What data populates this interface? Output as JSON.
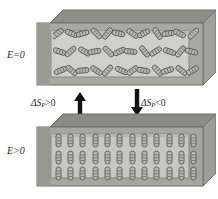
{
  "figure": {
    "background_color": "#ffffff"
  },
  "labels": {
    "field_off": "E=0",
    "field_on": "E>0",
    "entropy_increase": "ΔS",
    "entropy_increase_sub": "P",
    "entropy_increase_op": ">0",
    "entropy_decrease": "ΔS",
    "entropy_decrease_sub": "P",
    "entropy_decrease_op": "<0"
  },
  "arrows": [
    {
      "name": "arrow-up",
      "direction": "up",
      "color": "#111111",
      "meaning": "depolarization, entropy increases"
    },
    {
      "name": "arrow-down",
      "direction": "down",
      "color": "#111111",
      "meaning": "polarization, entropy decreases"
    }
  ],
  "slabs": [
    {
      "name": "slab-disordered",
      "state": "E=0",
      "ordering": "random",
      "rows": 3,
      "columns": 12,
      "face_color": "#cfcfcb",
      "frame_color": "#9d9d98",
      "top_face_color": "#8e8e8a",
      "side_face_color": "#a8a8a3",
      "edge_color": "#6e6e6a"
    },
    {
      "name": "slab-ordered",
      "state": "E>0",
      "ordering": "aligned-vertical",
      "rows": 3,
      "columns": 12,
      "face_color": "#c7c7c2",
      "frame_color": "#9a9a95",
      "top_face_color": "#8b8b87",
      "side_face_color": "#a4a4a0",
      "edge_color": "#6c6c68"
    }
  ],
  "molecule": {
    "shape": "rod-capsule",
    "outline_color": "#4a4a48",
    "fill_color": "#b9b9b4",
    "length": 13,
    "width": 5
  },
  "disordered_angles": [
    [
      -38,
      22,
      -15,
      48,
      -52,
      12,
      35,
      -28,
      58,
      -8,
      27,
      -45
    ],
    [
      18,
      -42,
      30,
      -10,
      44,
      -25,
      6,
      52,
      -33,
      20,
      -50,
      14
    ],
    [
      -22,
      40,
      -6,
      33,
      -48,
      24,
      -36,
      10,
      46,
      -18,
      38,
      -29
    ]
  ],
  "ordered_angles": [
    [
      0,
      0,
      0,
      0,
      0,
      0,
      0,
      0,
      0,
      0,
      0,
      0
    ],
    [
      0,
      0,
      0,
      0,
      0,
      0,
      0,
      0,
      0,
      0,
      0,
      0
    ],
    [
      0,
      0,
      0,
      0,
      0,
      0,
      0,
      0,
      0,
      0,
      0,
      0
    ]
  ]
}
